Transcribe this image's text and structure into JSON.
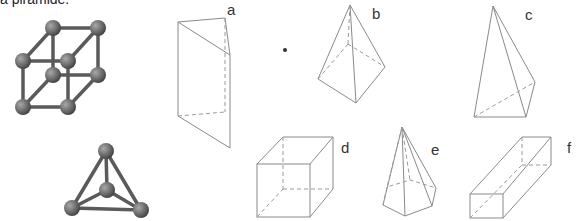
{
  "caption": "a piramide.",
  "models": [
    {
      "name": "cubic-molecule-model",
      "shape": "cube ball-and-stick"
    },
    {
      "name": "tetrahedral-molecule-model",
      "shape": "tetrahedron ball-and-stick"
    }
  ],
  "figures": [
    {
      "label": "a",
      "shape": "triangular prism"
    },
    {
      "label": "b",
      "shape": "triangular pyramid"
    },
    {
      "label": "c",
      "shape": "triangular pyramid"
    },
    {
      "label": "d",
      "shape": "cube"
    },
    {
      "label": "e",
      "shape": "pentagonal pyramid"
    },
    {
      "label": "f",
      "shape": "rectangular prism"
    }
  ],
  "colors": {
    "edge": "#8a8a8a",
    "bond": "#5a5a5a",
    "atom": "#6b6b6b",
    "label": "#333333"
  }
}
